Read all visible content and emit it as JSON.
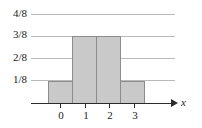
{
  "chart_data": {
    "type": "bar",
    "title": "",
    "subtitle": "",
    "xlabel": "x",
    "ylabel": "",
    "categories": [
      "0",
      "1",
      "2",
      "3"
    ],
    "values": [
      0.125,
      0.375,
      0.375,
      0.125
    ],
    "value_labels": [
      "1/8",
      "3/8",
      "3/8",
      "1/8"
    ],
    "xtick_labels": [
      "0",
      "1",
      "2",
      "3"
    ],
    "ytick_labels": [
      "4/8",
      "3/8",
      "2/8",
      "1/8"
    ],
    "ytick_values": [
      0.5,
      0.375,
      0.25,
      0.125
    ],
    "ylim": [
      0,
      0.5
    ],
    "xlim": [
      -0.5,
      3.5
    ],
    "grid": true,
    "grid_axis": "y",
    "legend": false,
    "legend_position": "none",
    "bar_fill_color": "#c9c9c9",
    "bar_edge_color": "#8c8c8c",
    "gridline_color": "#b9b9b9",
    "axis_color": "#2b2b2b",
    "text_color": "#1a1a1a",
    "axis_arrow": true,
    "annotations": []
  }
}
